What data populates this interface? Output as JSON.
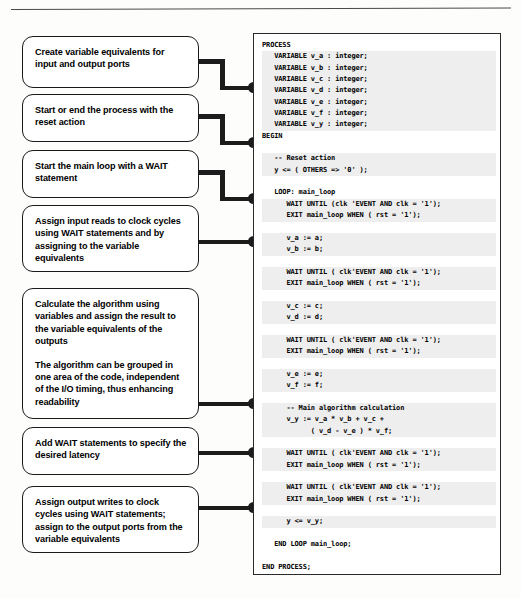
{
  "diagram": {
    "top_rule": true
  },
  "callouts": [
    {
      "id": "create-variable-equivalents",
      "paragraphs": [
        "Create variable equivalents for input and output ports"
      ]
    },
    {
      "id": "start-or-end-process",
      "paragraphs": [
        "Start or end  the process with the reset action"
      ]
    },
    {
      "id": "start-main-loop",
      "paragraphs": [
        "Start the main loop with a WAIT statement"
      ]
    },
    {
      "id": "assign-input-reads",
      "paragraphs": [
        "Assign input reads to clock cycles using WAIT statements and by assigning to the variable equivalents"
      ]
    },
    {
      "id": "calculate-algorithm",
      "paragraphs": [
        "Calculate the algorithm using variables and assign the result to the variable equivalents of the outputs",
        "The algorithm can be grouped in one area of the code, independent of the I/O timing, thus enhancing readability"
      ]
    },
    {
      "id": "add-wait-statements",
      "paragraphs": [
        "Add WAIT statements to specify the desired latency"
      ]
    },
    {
      "id": "assign-output-writes",
      "paragraphs": [
        "Assign output writes to clock cycles using WAIT statements; assign to the output ports from the variable equivalents"
      ]
    }
  ],
  "code_panel": {
    "language": "VHDL",
    "lines": [
      {
        "text": "PROCESS",
        "highlight": false
      },
      {
        "text": "   VARIABLE v_a : integer;",
        "highlight": true
      },
      {
        "text": "   VARIABLE v_b : integer;",
        "highlight": true
      },
      {
        "text": "   VARIABLE v_c : integer;",
        "highlight": true
      },
      {
        "text": "   VARIABLE v_d : integer;",
        "highlight": true
      },
      {
        "text": "   VARIABLE v_e : integer;",
        "highlight": true
      },
      {
        "text": "   VARIABLE v_f : integer;",
        "highlight": true
      },
      {
        "text": "   VARIABLE v_y : integer;",
        "highlight": true
      },
      {
        "text": "BEGIN",
        "highlight": false
      },
      {
        "text": "",
        "highlight": false
      },
      {
        "text": "   -- Reset action",
        "highlight": true
      },
      {
        "text": "   y <= ( OTHERS => '0' );",
        "highlight": true
      },
      {
        "text": "",
        "highlight": false
      },
      {
        "text": "   LOOP: main_loop",
        "highlight": false
      },
      {
        "text": "      WAIT UNTIL (clk 'EVENT AND clk = '1');",
        "highlight": true
      },
      {
        "text": "      EXIT main_loop WHEN ( rst = '1');",
        "highlight": true
      },
      {
        "text": "",
        "highlight": false
      },
      {
        "text": "      v_a := a;",
        "highlight": true
      },
      {
        "text": "      v_b := b;",
        "highlight": true
      },
      {
        "text": "",
        "highlight": false
      },
      {
        "text": "      WAIT UNTIL ( clk'EVENT AND clk = '1');",
        "highlight": true
      },
      {
        "text": "      EXIT main_loop WHEN ( rst = '1');",
        "highlight": true
      },
      {
        "text": "",
        "highlight": false
      },
      {
        "text": "      v_c := c;",
        "highlight": true
      },
      {
        "text": "      v_d := d;",
        "highlight": true
      },
      {
        "text": "",
        "highlight": false
      },
      {
        "text": "      WAIT UNTIL ( clk'EVENT AND clk = '1');",
        "highlight": true
      },
      {
        "text": "      EXIT main_loop WHEN ( rst = '1');",
        "highlight": true
      },
      {
        "text": "",
        "highlight": false
      },
      {
        "text": "      v_e := e;",
        "highlight": true
      },
      {
        "text": "      v_f := f;",
        "highlight": true
      },
      {
        "text": "",
        "highlight": false
      },
      {
        "text": "      -- Main algorithm calculation",
        "highlight": true
      },
      {
        "text": "      v_y := v_a * v_b + v_c +",
        "highlight": true
      },
      {
        "text": "            ( v_d - v_e ) * v_f;",
        "highlight": true
      },
      {
        "text": "",
        "highlight": false
      },
      {
        "text": "      WAIT UNTIL ( clk'EVENT AND clk = '1');",
        "highlight": true
      },
      {
        "text": "      EXIT main_loop WHEN ( rst = '1');",
        "highlight": true
      },
      {
        "text": "",
        "highlight": false
      },
      {
        "text": "      WAIT UNTIL ( clk'EVENT AND clk = '1');",
        "highlight": true
      },
      {
        "text": "      EXIT main_loop WHEN ( rst = '1');",
        "highlight": true
      },
      {
        "text": "",
        "highlight": false
      },
      {
        "text": "      y <= v_y;",
        "highlight": true
      },
      {
        "text": "",
        "highlight": false
      },
      {
        "text": "   END LOOP main_loop;",
        "highlight": false
      },
      {
        "text": "",
        "highlight": false
      },
      {
        "text": "END PROCESS;",
        "highlight": false
      }
    ]
  },
  "connectors": [
    {
      "id": "connector-create-variable-equivalents"
    },
    {
      "id": "connector-start-or-end-process"
    },
    {
      "id": "connector-start-main-loop"
    },
    {
      "id": "connector-assign-input-reads"
    },
    {
      "id": "connector-calculate-algorithm"
    },
    {
      "id": "connector-add-wait-statements"
    },
    {
      "id": "connector-assign-output-writes"
    }
  ],
  "colors": {
    "ink": "#1a1a1a",
    "panel_border": "#2a2a2a",
    "code_highlight": "#eeeeee",
    "page_background": "#fdfdfc"
  }
}
